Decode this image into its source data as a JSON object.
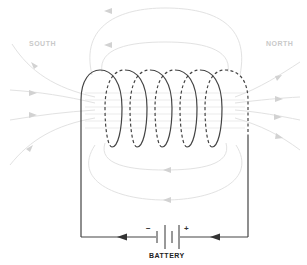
{
  "diagram": {
    "labels": {
      "south": "SOUTH",
      "north": "NORTH",
      "battery": "BATTERY",
      "negative": "−",
      "positive": "+"
    },
    "coil": {
      "turns": 6
    },
    "colors": {
      "wire": "#444444",
      "field_lines": "#dddddd",
      "field_arrows": "#cfcfcf",
      "pole_label": "#c9c9c9",
      "battery_label": "#222222",
      "background": "#ffffff"
    },
    "current_direction": "right-to-left along bottom wire",
    "field_direction": "enters at SOUTH (left), exits at NORTH (right), returns over top and bottom"
  }
}
